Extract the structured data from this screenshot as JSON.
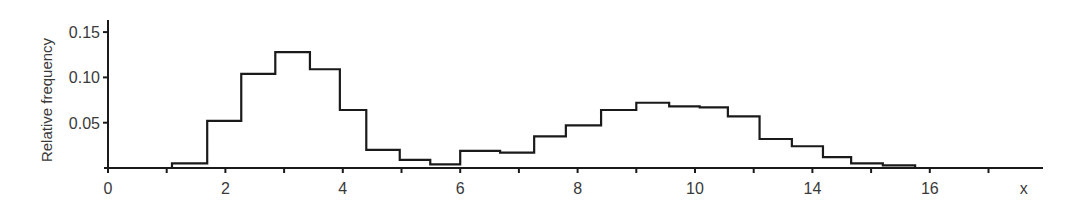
{
  "chart_data": {
    "type": "bar",
    "subtype": "step-histogram",
    "title": "",
    "xlabel": "x",
    "ylabel": "Relative frequency",
    "xlim": [
      0,
      16.1
    ],
    "ylim": [
      0,
      0.16
    ],
    "grid": false,
    "legend": null,
    "x_ticks": [
      0,
      1,
      2,
      3,
      4,
      5,
      6,
      7,
      8,
      9,
      10,
      11,
      12,
      13,
      14,
      15
    ],
    "x_tick_labels": [
      {
        "pos": 0,
        "label": "0"
      },
      {
        "pos": 2,
        "label": "2"
      },
      {
        "pos": 4,
        "label": "4"
      },
      {
        "pos": 6,
        "label": "6"
      },
      {
        "pos": 8,
        "label": "8"
      },
      {
        "pos": 10,
        "label": "10"
      },
      {
        "pos": 12,
        "label": "14"
      },
      {
        "pos": 14,
        "label": "16"
      },
      {
        "pos": 15.6,
        "label": "x"
      }
    ],
    "y_ticks": [
      0.05,
      0.1,
      0.15
    ],
    "y_tick_labels": [
      "0.05",
      "0.10",
      "0.15"
    ],
    "bin_edges": [
      1.09,
      1.69,
      2.27,
      2.85,
      3.44,
      3.95,
      4.4,
      4.97,
      5.49,
      6.0,
      6.68,
      7.26,
      7.8,
      8.4,
      9.0,
      9.56,
      10.08,
      10.56,
      11.1,
      11.65,
      12.18,
      12.66,
      13.2,
      13.75
    ],
    "values": [
      0.005,
      0.052,
      0.104,
      0.128,
      0.109,
      0.064,
      0.02,
      0.009,
      0.004,
      0.019,
      0.017,
      0.035,
      0.047,
      0.064,
      0.072,
      0.068,
      0.067,
      0.057,
      0.032,
      0.024,
      0.012,
      0.005,
      0.003
    ]
  },
  "style": {
    "line_color": "#1a1a1a",
    "axis_color": "#1a1a1a",
    "text_color": "#3a3a3a"
  }
}
